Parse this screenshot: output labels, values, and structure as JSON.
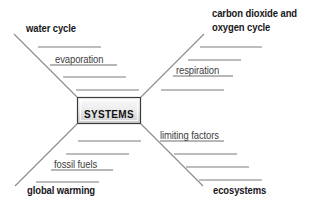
{
  "diagram": {
    "type": "concept-map",
    "title_hub": "SYSTEMS",
    "background_color": "#ffffff",
    "line_color": "#8a8a8a",
    "text_color": "#17171a",
    "hub_fill_light": "#f4f4f4",
    "hub_fill_dark": "#d2d2d2",
    "hub_border": "#3a3a3a",
    "branches": [
      {
        "id": "top-left",
        "heading": "water cycle",
        "heading_lines": [
          "water cycle"
        ],
        "entries": [
          {
            "text": "",
            "filled": false
          },
          {
            "text": "evaporation",
            "filled": true
          },
          {
            "text": "",
            "filled": false
          },
          {
            "text": "",
            "filled": false
          }
        ]
      },
      {
        "id": "top-right",
        "heading": "carbon dioxide and oxygen cycle",
        "heading_lines": [
          "carbon dioxide and",
          "oxygen cycle"
        ],
        "entries": [
          {
            "text": "",
            "filled": false
          },
          {
            "text": "",
            "filled": false
          },
          {
            "text": "respiration",
            "filled": true
          },
          {
            "text": "",
            "filled": false
          }
        ]
      },
      {
        "id": "bottom-left",
        "heading": "global warming",
        "heading_lines": [
          "global warming"
        ],
        "entries": [
          {
            "text": "",
            "filled": false
          },
          {
            "text": "",
            "filled": false
          },
          {
            "text": "fossil fuels",
            "filled": true
          },
          {
            "text": "",
            "filled": false
          }
        ]
      },
      {
        "id": "bottom-right",
        "heading": "ecosystems",
        "heading_lines": [
          "ecosystems"
        ],
        "entries": [
          {
            "text": "limiting factors",
            "filled": true
          },
          {
            "text": "",
            "filled": false
          },
          {
            "text": "",
            "filled": false
          },
          {
            "text": "",
            "filled": false
          }
        ]
      }
    ]
  }
}
